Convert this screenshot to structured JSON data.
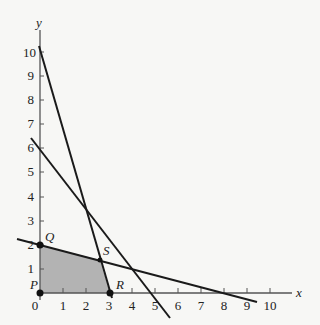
{
  "figure": {
    "x_axis_label": "x",
    "y_axis_label": "y",
    "x_ticks": [
      "1",
      "2",
      "3",
      "4",
      "5",
      "6",
      "7",
      "8",
      "9",
      "10"
    ],
    "y_ticks": [
      "1",
      "2",
      "3",
      "4",
      "5",
      "6",
      "7",
      "8",
      "9",
      "10"
    ],
    "origin_label": "0",
    "points": [
      {
        "name": "P",
        "x": 0,
        "y": 0
      },
      {
        "name": "Q",
        "x": 0,
        "y": 2
      },
      {
        "name": "R",
        "x": 3,
        "y": 0
      },
      {
        "name": "S",
        "x": 2.6,
        "y": 1.35
      }
    ],
    "lines": [
      {
        "id": "line-1",
        "through": [
          [
            0,
            10
          ],
          [
            3,
            0
          ]
        ]
      },
      {
        "id": "line-2",
        "through": [
          [
            0,
            6
          ],
          [
            5,
            0
          ]
        ]
      },
      {
        "id": "line-3",
        "through": [
          [
            0,
            2
          ],
          [
            8,
            0
          ]
        ]
      }
    ],
    "shaded_region": "PQSR",
    "colors": {
      "shade": "#b3b3b3",
      "ink": "#1a1a1a"
    }
  }
}
